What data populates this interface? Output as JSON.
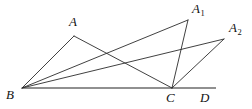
{
  "figure": {
    "width": 252,
    "height": 109,
    "background_color": "#ffffff",
    "stroke_color": "#2b2b2b",
    "baseline_color": "#6b6b6b",
    "stroke_width": 0.9,
    "baseline_width": 1.6
  },
  "points": {
    "B": {
      "label": "B",
      "sub": "",
      "x": 22,
      "y": 88,
      "label_x": 6,
      "label_y": 88
    },
    "C": {
      "label": "C",
      "sub": "",
      "x": 172,
      "y": 88,
      "label_x": 166,
      "label_y": 91
    },
    "D": {
      "label": "D",
      "sub": "",
      "x": 216,
      "y": 88,
      "label_x": 200,
      "label_y": 91
    },
    "A": {
      "label": "A",
      "sub": "",
      "x": 74,
      "y": 36,
      "label_x": 69,
      "label_y": 15
    },
    "A1": {
      "label": "A",
      "sub": "1",
      "x": 188,
      "y": 20,
      "label_x": 192,
      "label_y": 2
    },
    "A2": {
      "label": "A",
      "sub": "2",
      "x": 224,
      "y": 39,
      "label_x": 229,
      "label_y": 21
    }
  },
  "segments": [
    {
      "name": "base-line-B-D",
      "from": "B",
      "to": "D",
      "kind": "baseline"
    },
    {
      "name": "segment-B-A",
      "from": "B",
      "to": "A",
      "kind": "edge"
    },
    {
      "name": "segment-A-C",
      "from": "A",
      "to": "C",
      "kind": "edge"
    },
    {
      "name": "segment-B-A1",
      "from": "B",
      "to": "A1",
      "kind": "edge"
    },
    {
      "name": "segment-A1-C",
      "from": "A1",
      "to": "C",
      "kind": "edge"
    },
    {
      "name": "segment-B-A2",
      "from": "B",
      "to": "A2",
      "kind": "edge"
    },
    {
      "name": "segment-A2-C",
      "from": "A2",
      "to": "C",
      "kind": "edge"
    }
  ],
  "labels": {
    "A": "A",
    "A1": "A",
    "A1_sub": "1",
    "A2": "A",
    "A2_sub": "2",
    "B": "B",
    "C": "C",
    "D": "D"
  }
}
